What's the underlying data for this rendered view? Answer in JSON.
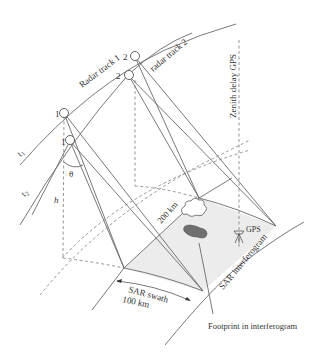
{
  "diagram": {
    "labels": {
      "radar_track_1": "Radar track 1",
      "radar_track_2": "radar track 2",
      "zenith_delay_gps": "Zenith delay GPS",
      "t1": "t",
      "t1_sub": "1",
      "t2": "t",
      "t2_sub": "2",
      "theta": "θ",
      "h": "h",
      "sat_track1_pos1": "1",
      "sat_track1_pos2": "2",
      "sat_track2_pos1": "1",
      "sat_track2_pos2": "2",
      "distance_200": "200 km",
      "gps": "GPS",
      "sar_interferogram": "SAR interferogram",
      "sar_swath": "SAR swath",
      "swath_width": "100 km",
      "footprint": "Footprint in interferogram"
    },
    "colors": {
      "line": "#6a6a6a",
      "swath_fill": "#ececec",
      "footprint_fill": "#6f6f6f",
      "text": "#333333"
    }
  }
}
